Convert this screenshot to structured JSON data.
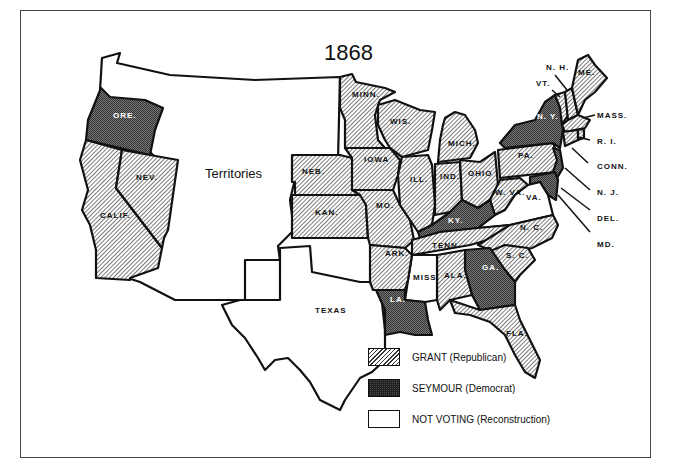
{
  "title": "1868",
  "map_type": "US Presidential Election Results",
  "territories_label": "Territories",
  "colors": {
    "grant": "#cfcfcf",
    "seymour": "#555555",
    "not_voting": "#ffffff",
    "border": "#111111"
  },
  "legend": [
    {
      "key": "grant",
      "label": "GRANT (Republican)",
      "pattern": "diagonal-hatch"
    },
    {
      "key": "seymour",
      "label": "SEYMOUR (Democrat)",
      "pattern": "dark-crosshatch"
    },
    {
      "key": "not_voting",
      "label": "NOT VOTING (Reconstruction)",
      "pattern": "blank"
    }
  ],
  "states": {
    "grant": [
      "CALIF.",
      "NEV.",
      "NEB.",
      "KAN.",
      "MINN.",
      "IOWA",
      "MO.",
      "WIS.",
      "ILL.",
      "MICH.",
      "IND.",
      "OHIO",
      "PA.",
      "W. VA.",
      "TENN.",
      "ARK.",
      "ALA.",
      "N. C.",
      "S. C.",
      "FLA.",
      "VT.",
      "N. H.",
      "ME.",
      "MASS.",
      "R. I.",
      "CONN."
    ],
    "seymour": [
      "ORE.",
      "N. Y.",
      "N. J.",
      "DEL.",
      "MD.",
      "KY.",
      "GA.",
      "LA."
    ],
    "not_voting": [
      "TEXAS",
      "MISS.",
      "VA."
    ]
  },
  "labels": {
    "ore": "ORE.",
    "calif": "CALIF.",
    "nev": "NEV.",
    "neb": "NEB.",
    "kan": "KAN.",
    "minn": "MINN.",
    "iowa": "IOWA",
    "mo": "MO.",
    "wis": "WIS.",
    "ill": "ILL.",
    "mich": "MICH.",
    "ind": "IND.",
    "ohio": "OHIO",
    "pa": "PA.",
    "ny": "N. Y.",
    "wva": "W. VA.",
    "va": "VA.",
    "ky": "KY.",
    "tenn": "TENN.",
    "nc": "N. C.",
    "sc": "S. C.",
    "ga": "GA.",
    "ala": "ALA.",
    "miss": "MISS.",
    "ark": "ARK.",
    "la": "LA.",
    "texas": "TEXAS",
    "fla": "FLA.",
    "me": "ME.",
    "nh": "N. H.",
    "vt": "VT.",
    "mass": "MASS.",
    "ri": "R. I.",
    "conn": "CONN.",
    "nj": "N. J.",
    "del": "DEL.",
    "md": "MD."
  }
}
